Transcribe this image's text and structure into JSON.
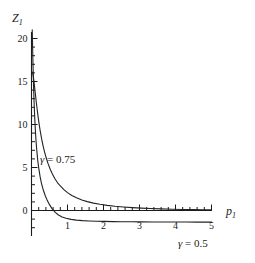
{
  "chart_data": {
    "type": "line",
    "title": "",
    "subtitle": "",
    "xlabel": "p",
    "xlabel_sub": "1",
    "ylabel": "Z",
    "ylabel_sub": "1",
    "xlim": [
      0,
      5
    ],
    "ylim": [
      -2,
      22
    ],
    "grid": false,
    "legend_position": "inline-annotation",
    "xticks": [
      1,
      2,
      3,
      4,
      5
    ],
    "xtick_labels": [
      "1",
      "2",
      "3",
      "4",
      "5"
    ],
    "yticks": [
      0,
      5,
      10,
      15,
      20
    ],
    "ytick_labels": [
      "0",
      "5",
      "10",
      "15",
      "20"
    ],
    "minor_tick_subdivisions": 5,
    "axis_color": "#1a1a1a",
    "curve_color": "#222222",
    "background": "#ffffff",
    "annotations": [
      {
        "name": "gamma-075",
        "symbol": "γ",
        "text": "γ = 0.75",
        "equals": " = ",
        "value": "0.75",
        "x_data": 0.32,
        "y_data": 6.4
      },
      {
        "name": "gamma-05",
        "symbol": "γ",
        "text": "γ = 0.5",
        "equals": " = ",
        "value": "0.5",
        "x_data": 4.1,
        "y_data": -3.3
      }
    ],
    "series": [
      {
        "name": "γ = 0.75",
        "label": "gamma-075",
        "color": "#222222",
        "x": [
          0.03,
          0.05,
          0.07,
          0.09,
          0.11,
          0.13,
          0.15,
          0.18,
          0.21,
          0.24,
          0.28,
          0.32,
          0.36,
          0.41,
          0.46,
          0.52,
          0.58,
          0.65,
          0.72,
          0.8,
          0.9,
          1.0,
          1.12,
          1.25,
          1.4,
          1.55,
          1.72,
          1.9,
          2.1,
          2.32,
          2.55,
          2.8,
          3.05,
          3.3,
          3.6,
          3.9,
          4.2,
          4.5,
          4.75,
          5.0
        ],
        "y": [
          16.1,
          15.6,
          14.95,
          14.2,
          13.45,
          12.7,
          12.0,
          11.0,
          10.1,
          9.3,
          8.35,
          7.55,
          6.85,
          6.1,
          5.45,
          4.8,
          4.25,
          3.7,
          3.25,
          2.85,
          2.42,
          2.08,
          1.75,
          1.47,
          1.22,
          1.03,
          0.86,
          0.72,
          0.6,
          0.49,
          0.41,
          0.34,
          0.28,
          0.24,
          0.19,
          0.15,
          0.12,
          0.1,
          0.08,
          0.07
        ]
      },
      {
        "name": "γ = 0.5",
        "label": "gamma-05",
        "color": "#222222",
        "x": [
          0.02,
          0.03,
          0.04,
          0.05,
          0.06,
          0.07,
          0.08,
          0.1,
          0.12,
          0.14,
          0.17,
          0.2,
          0.24,
          0.28,
          0.33,
          0.38,
          0.44,
          0.5,
          0.58,
          0.66,
          0.75,
          0.85,
          0.96,
          1.1,
          1.25,
          1.42,
          1.6,
          1.8,
          2.02,
          2.25,
          2.5,
          2.78,
          3.05,
          3.35,
          3.65,
          4.0,
          4.3,
          4.6,
          4.8,
          5.0
        ],
        "y": [
          21.0,
          19.2,
          17.3,
          15.6,
          14.1,
          12.8,
          11.7,
          9.9,
          8.45,
          7.3,
          5.95,
          4.95,
          3.9,
          3.1,
          2.35,
          1.75,
          1.15,
          0.68,
          0.16,
          -0.22,
          -0.52,
          -0.75,
          -0.9,
          -1.03,
          -1.12,
          -1.18,
          -1.22,
          -1.25,
          -1.27,
          -1.29,
          -1.3,
          -1.31,
          -1.32,
          -1.33,
          -1.33,
          -1.34,
          -1.34,
          -1.35,
          -1.35,
          -1.35
        ]
      }
    ]
  }
}
